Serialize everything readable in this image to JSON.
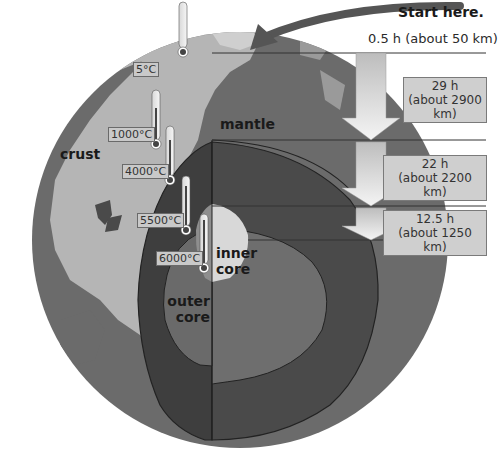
{
  "start_label": "Start here.",
  "layers": {
    "crust": "crust",
    "mantle": "mantle",
    "outer_core": "outer core",
    "inner_core": "inner core"
  },
  "temperatures": [
    {
      "id": "t1",
      "value": "5°C"
    },
    {
      "id": "t2",
      "value": "1000°C"
    },
    {
      "id": "t3",
      "value": "4000°C"
    },
    {
      "id": "t4",
      "value": "5500°C"
    },
    {
      "id": "t5",
      "value": "6000°C"
    }
  ],
  "depth_legs": [
    {
      "time": "0.5 h (about 50 km)"
    },
    {
      "time": "29 h",
      "distance": "(about 2900 km)"
    },
    {
      "time": "22 h",
      "distance": "(about 2200 km)"
    },
    {
      "time": "12.5 h",
      "distance": "(about 1250 km)"
    }
  ],
  "colors": {
    "background": "#ffffff",
    "ocean": "#6b6b6b",
    "land": "#b8b8b8",
    "mantle": "#4a4a4a",
    "outer_core": "#6e6e6e",
    "inner_core": "#d6d6d6",
    "arrow": "#e6e6e6"
  }
}
